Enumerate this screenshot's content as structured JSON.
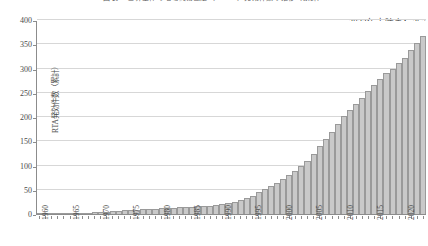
{
  "chart_data": {
    "type": "bar",
    "title": "図表 　世界全体の地域貿易協定（ＲＴＡ）発効件数の推移（累計）",
    "xlabel": "",
    "ylabel": "RTA発効件数（累計）",
    "ylim": [
      0,
      400
    ],
    "yticks": [
      0,
      50,
      100,
      150,
      200,
      250,
      300,
      350,
      400
    ],
    "xlim": [
      1960,
      2023
    ],
    "xtick_labels": [
      "1960",
      "1965",
      "1970",
      "1975",
      "1980",
      "1985",
      "1990",
      "1995",
      "2000",
      "2005",
      "2010",
      "2015",
      "2020"
    ],
    "grid": true,
    "legend": "none",
    "bar_color": "#c9c9c9",
    "bar_edge_color": "#9a9a9a",
    "annotations": [
      {
        "text": "2023年末時点：367",
        "position": "top-right"
      }
    ],
    "categories": [
      "1960",
      "1961",
      "1962",
      "1963",
      "1964",
      "1965",
      "1966",
      "1967",
      "1968",
      "1969",
      "1970",
      "1971",
      "1972",
      "1973",
      "1974",
      "1975",
      "1976",
      "1977",
      "1978",
      "1979",
      "1980",
      "1981",
      "1982",
      "1983",
      "1984",
      "1985",
      "1986",
      "1987",
      "1988",
      "1989",
      "1990",
      "1991",
      "1992",
      "1993",
      "1994",
      "1995",
      "1996",
      "1997",
      "1998",
      "1999",
      "2000",
      "2001",
      "2002",
      "2003",
      "2004",
      "2005",
      "2006",
      "2007",
      "2008",
      "2009",
      "2010",
      "2011",
      "2012",
      "2013",
      "2014",
      "2015",
      "2016",
      "2017",
      "2018",
      "2019",
      "2020",
      "2021",
      "2022",
      "2023"
    ],
    "values": [
      1,
      2,
      2,
      2,
      3,
      3,
      3,
      3,
      3,
      4,
      4,
      5,
      6,
      7,
      8,
      9,
      9,
      10,
      10,
      11,
      12,
      12,
      13,
      14,
      14,
      15,
      16,
      16,
      17,
      18,
      20,
      22,
      25,
      28,
      32,
      38,
      45,
      52,
      58,
      64,
      72,
      80,
      88,
      98,
      110,
      124,
      140,
      154,
      170,
      186,
      202,
      214,
      226,
      240,
      254,
      266,
      278,
      290,
      300,
      312,
      322,
      338,
      352,
      367
    ]
  }
}
